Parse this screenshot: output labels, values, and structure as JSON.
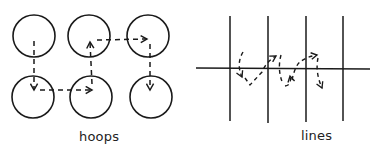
{
  "panels": [
    {
      "id": "hoops",
      "label": "hoops",
      "circles": [
        {
          "cx": 34,
          "cy": 36,
          "r": 21
        },
        {
          "cx": 89,
          "cy": 36,
          "r": 21
        },
        {
          "cx": 148,
          "cy": 36,
          "r": 21
        },
        {
          "cx": 33,
          "cy": 97,
          "r": 21
        },
        {
          "cx": 91,
          "cy": 97,
          "r": 21
        },
        {
          "cx": 151,
          "cy": 97,
          "r": 21
        }
      ],
      "path_description": "dashed arrow path: down from top-left circle into bottom-left, right into bottom-middle, up into top-middle, right into top-right, down into bottom-right"
    },
    {
      "id": "lines",
      "label": "lines",
      "vertical_lines_x": [
        230,
        268,
        306,
        343
      ],
      "horizontal_line_y": 68,
      "path_description": "dashed looping arrow path weaving across the horizontal line between vertical lines"
    }
  ],
  "colors": {
    "stroke": "#1a1a1a",
    "background": "#ffffff"
  }
}
